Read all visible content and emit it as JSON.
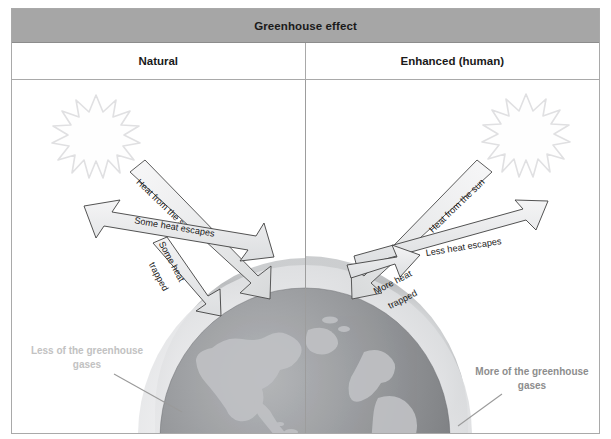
{
  "figure": {
    "title": "Greenhouse effect",
    "columns": [
      {
        "label": "Natural"
      },
      {
        "label": "Enhanced (human)"
      }
    ],
    "panels": {
      "natural": {
        "sun_label": "sun",
        "arrows": [
          {
            "name": "heat-from-sun",
            "label": "Heat from the sun"
          },
          {
            "name": "some-heat-escapes",
            "label": "Some heat escapes"
          },
          {
            "name": "some-heat-trapped",
            "label": "Some heat trapped"
          }
        ],
        "gases_label_line1": "Less of the greenhouse",
        "gases_label_line2": "gases"
      },
      "enhanced": {
        "sun_label": "sun",
        "arrows": [
          {
            "name": "heat-from-sun",
            "label": "Heat from the sun"
          },
          {
            "name": "less-heat-escapes",
            "label": "Less heat escapes"
          },
          {
            "name": "more-heat-trapped",
            "label": "More heat trapped"
          }
        ],
        "gases_label_line1": "More of the greenhouse",
        "gases_label_line2": "gases"
      }
    },
    "label_text": {
      "heat_from_sun": "Heat from the sun",
      "some_heat_escapes": "Some heat escapes",
      "some_heat_line1": "Some heat",
      "some_heat_line2": "trapped",
      "less_heat_escapes": "Less heat escapes",
      "more_heat_line1": "More heat",
      "more_heat_line2": "trapped",
      "less_gases_line1": "Less of the greenhouse",
      "less_gases_line2": "gases",
      "more_gases_line1": "More of the greenhouse",
      "more_gases_line2": "gases"
    },
    "colors": {
      "header_bg": "#a6a6a6",
      "border": "#a9a9a9",
      "text": "#1a1a1a",
      "earth_ocean": "#8f9194",
      "earth_land": "#b9bbbd",
      "atmosphere_inner": "#e3e4e6",
      "atmosphere_outer": "#bfc1c3",
      "arrow_fill": "#eceded",
      "arrow_stroke": "#3c3c3c",
      "sun_stroke": "#e2e2e4",
      "less_gases_text": "#c2c2c2",
      "more_gases_text": "#8d8d8d"
    }
  }
}
